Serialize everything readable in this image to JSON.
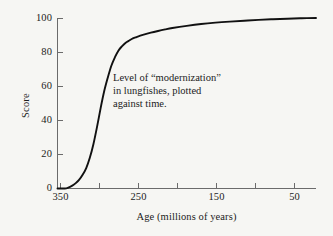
{
  "chart_data": {
    "type": "line",
    "title": "",
    "subtitle": "",
    "xlabel": "Age (millions of years)",
    "ylabel": "Score",
    "xlim": [
      360,
      0
    ],
    "ylim": [
      0,
      100
    ],
    "x_axis_reversed": true,
    "grid": false,
    "legend": null,
    "legend_position": "none",
    "xticks": [
      350,
      250,
      150,
      50
    ],
    "xtick_labels": [
      "350",
      "250",
      "150",
      "50"
    ],
    "x_minor_ticks": [
      300,
      200,
      100,
      0
    ],
    "yticks": [
      0,
      20,
      40,
      60,
      80,
      100
    ],
    "ytick_labels": [
      "0",
      "20",
      "40",
      "60",
      "80",
      "100"
    ],
    "line_color": "#111111",
    "line_width": 1.9,
    "annotations": [
      {
        "text_lines": [
          "Level of “modernization”",
          "in lungfishes, plotted",
          "against time."
        ],
        "x": 230,
        "y": 62
      }
    ],
    "series": [
      {
        "name": "Level of modernization in lungfishes",
        "x": [
          360,
          350,
          345,
          340,
          335,
          330,
          325,
          320,
          315,
          310,
          305,
          300,
          295,
          290,
          285,
          280,
          275,
          270,
          265,
          260,
          255,
          250,
          240,
          230,
          220,
          210,
          200,
          180,
          160,
          140,
          120,
          100,
          80,
          60,
          40,
          20,
          0
        ],
        "values": [
          0,
          0,
          0.5,
          1.5,
          3,
          5,
          8,
          12,
          18,
          26,
          36,
          47,
          57,
          65,
          72,
          77,
          81,
          83.5,
          85.5,
          86.8,
          88,
          88.8,
          90.2,
          91.4,
          92.4,
          93.3,
          94.1,
          95.4,
          96.5,
          97.3,
          97.9,
          98.4,
          98.9,
          99.3,
          99.6,
          99.85,
          100
        ]
      }
    ]
  },
  "figure": {
    "background_color": "#f6f6f3",
    "axis_color": "#4a4a4a"
  }
}
